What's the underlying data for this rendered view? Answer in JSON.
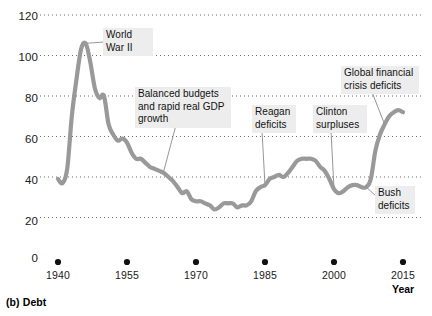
{
  "caption": "(b) Debt",
  "chart_data": {
    "type": "line",
    "title": "(b) Debt",
    "xlabel": "Year",
    "ylabel": "",
    "xlim": [
      1938,
      2016
    ],
    "ylim": [
      0,
      120
    ],
    "grid": "horizontal-dotted",
    "legend": "none",
    "line_color": "#999999",
    "y_ticks": [
      0,
      20,
      40,
      60,
      80,
      100,
      120
    ],
    "x_ticks": [
      1940,
      1955,
      1970,
      1985,
      2000,
      2015
    ],
    "series": [
      {
        "name": "Federal debt held by the public (percent of GDP)",
        "x": [
          1940,
          1941,
          1942,
          1943,
          1944,
          1945,
          1946,
          1947,
          1948,
          1949,
          1950,
          1951,
          1952,
          1953,
          1954,
          1955,
          1956,
          1957,
          1958,
          1959,
          1960,
          1961,
          1962,
          1963,
          1964,
          1965,
          1966,
          1967,
          1968,
          1969,
          1970,
          1971,
          1972,
          1973,
          1974,
          1975,
          1976,
          1977,
          1978,
          1979,
          1980,
          1981,
          1982,
          1983,
          1984,
          1985,
          1986,
          1987,
          1988,
          1989,
          1990,
          1991,
          1992,
          1993,
          1994,
          1995,
          1996,
          1997,
          1998,
          1999,
          2000,
          2001,
          2002,
          2003,
          2004,
          2005,
          2006,
          2007,
          2008,
          2009,
          2010,
          2011,
          2012,
          2013,
          2014,
          2015
        ],
        "y": [
          39,
          37,
          44,
          70,
          88,
          103,
          106,
          97,
          84,
          79,
          80,
          66,
          61,
          58,
          59,
          57,
          52,
          49,
          49,
          47,
          45,
          44,
          43,
          42,
          40,
          38,
          35,
          32,
          33,
          29,
          28,
          28,
          27,
          26,
          24,
          25,
          27,
          27,
          27,
          25,
          26,
          26,
          28,
          33,
          35,
          36,
          39,
          40,
          41,
          40,
          42,
          45,
          48,
          49,
          49,
          49,
          48,
          45,
          43,
          39,
          34,
          32,
          33,
          35,
          36,
          36,
          35,
          35,
          39,
          53,
          61,
          66,
          70,
          72,
          73,
          72
        ]
      }
    ],
    "annotations": [
      {
        "label": "World\nWar II",
        "target_x": 1946,
        "target_y": 106
      },
      {
        "label": "Balanced budgets\nand rapid real GDP\ngrowth",
        "target_x": 1963,
        "target_y": 43
      },
      {
        "label": "Reagan\ndeficits",
        "target_x": 1985,
        "target_y": 36
      },
      {
        "label": "Clinton\nsurpluses",
        "target_x": 2000,
        "target_y": 34
      },
      {
        "label": "Global financial\ncrisis deficits",
        "target_x": 2011,
        "target_y": 66
      },
      {
        "label": "Bush\ndeficits",
        "target_x": 2007,
        "target_y": 35
      }
    ]
  },
  "y_axis": {
    "labels": [
      "120",
      "100",
      "80",
      "60",
      "40",
      "20",
      "0"
    ]
  },
  "x_axis": {
    "labels": [
      "1940",
      "1955",
      "1970",
      "1985",
      "2000",
      "2015"
    ],
    "title": "Year"
  },
  "annotations": {
    "world_war_ii": "World\nWar II",
    "balanced_budgets": "Balanced budgets\nand rapid real GDP\ngrowth",
    "reagan_deficits": "Reagan\ndeficits",
    "clinton_surpluses": "Clinton\nsurpluses",
    "global_financial_crisis": "Global financial\ncrisis deficits",
    "bush_deficits": "Bush\ndeficits"
  }
}
